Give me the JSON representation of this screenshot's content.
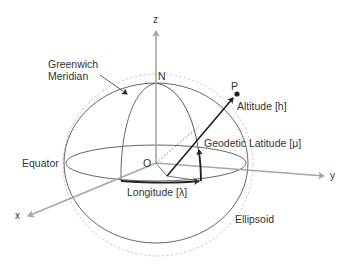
{
  "diagram": {
    "type": "geodetic-coordinate-system",
    "axes": {
      "z": "z",
      "y": "y",
      "x": "x"
    },
    "points": {
      "origin": "O",
      "north": "N",
      "point": "P"
    },
    "labels": {
      "greenwich_line1": "Greenwich",
      "greenwich_line2": "Meridian",
      "altitude": "Altitude [h]",
      "geodetic_latitude": "Geodetic Latitude [μ]",
      "equator": "Equator",
      "longitude": "Longitude [λ]",
      "ellipsoid": "Ellipsoid"
    },
    "colors": {
      "axis": "#a6a6a6",
      "outline": "#555555",
      "vector": "#333333",
      "dashed": "#bdbdbd"
    }
  }
}
